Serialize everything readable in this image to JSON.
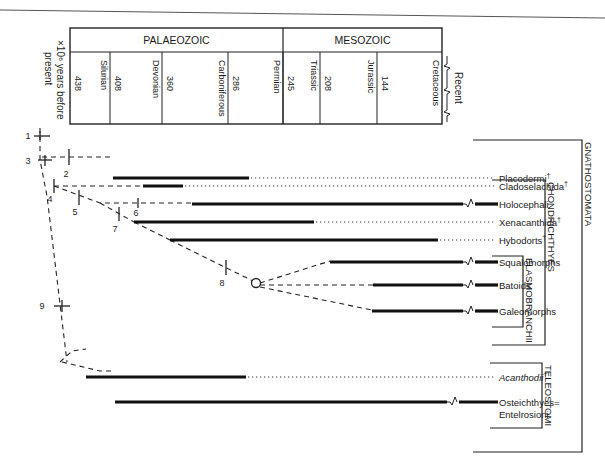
{
  "header": {
    "axis_label_lines": [
      "×10⁶ years before",
      "present"
    ],
    "eras": [
      {
        "name": "PALAEOZOIC",
        "x1": 70,
        "x2": 283
      },
      {
        "name": "MESOZOIC",
        "x1": 283,
        "x2": 442
      }
    ],
    "periods": [
      {
        "name": "Silurian",
        "start": "438",
        "x1": 70,
        "x2": 110
      },
      {
        "name": "Devonian",
        "start": "408",
        "x1": 110,
        "x2": 162
      },
      {
        "name": "Carboniferous",
        "start": "360",
        "x1": 162,
        "x2": 228
      },
      {
        "name": "Permian",
        "start": "286",
        "x1": 228,
        "x2": 283
      },
      {
        "name": "Triassic",
        "start": "245",
        "x1": 283,
        "x2": 320
      },
      {
        "name": "Jurassic",
        "start": "208",
        "x1": 320,
        "x2": 377
      },
      {
        "name": "Cretaceous",
        "start": "144",
        "x1": 377,
        "x2": 442
      }
    ],
    "recent_label": "Recent"
  },
  "taxa": [
    {
      "name": "Placodermi",
      "dagger": true,
      "italic": false,
      "y": 178,
      "bar_x1": 113,
      "bar_x2": 249,
      "fossil_end": "extinct"
    },
    {
      "name": "Cladoselachida",
      "dagger": true,
      "italic": false,
      "y": 186,
      "bar_x1": 143,
      "bar_x2": 183,
      "fossil_end": "extinct"
    },
    {
      "name": "Holocephali",
      "dagger": false,
      "italic": false,
      "y": 204,
      "bar_x1": 192,
      "bar_x2": 463,
      "fossil_end": "living"
    },
    {
      "name": "Xenacanthida",
      "dagger": true,
      "italic": false,
      "y": 222,
      "bar_x1": 134,
      "bar_x2": 314,
      "fossil_end": "extinct"
    },
    {
      "name": "Hybodorts",
      "dagger": true,
      "italic": false,
      "y": 240,
      "bar_x1": 170,
      "bar_x2": 438,
      "fossil_end": "extinct"
    },
    {
      "name": "Squalomorphs",
      "dagger": false,
      "italic": false,
      "y": 262,
      "bar_x1": 330,
      "bar_x2": 463,
      "fossil_end": "living"
    },
    {
      "name": "Batoids",
      "dagger": false,
      "italic": false,
      "y": 285,
      "bar_x1": 373,
      "bar_x2": 463,
      "fossil_end": "living"
    },
    {
      "name": "Galeomorphs",
      "dagger": false,
      "italic": false,
      "y": 311,
      "bar_x1": 372,
      "bar_x2": 463,
      "fossil_end": "living"
    },
    {
      "name": "Acanthodii",
      "dagger": true,
      "italic": true,
      "y": 377,
      "bar_x1": 86,
      "bar_x2": 246,
      "fossil_end": "extinct"
    },
    {
      "name": "Osteichthyes=",
      "name_line2": "Entelrosioni",
      "dagger": false,
      "italic": false,
      "y": 402,
      "bar_x1": 115,
      "bar_x2": 447,
      "fossil_end": "living"
    }
  ],
  "nodes": [
    {
      "label": "1",
      "x": 12,
      "y": 138
    },
    {
      "label": "2",
      "x": 70,
      "y": 158
    },
    {
      "label": "3",
      "x": 30,
      "y": 162
    },
    {
      "label": "4",
      "x": 55,
      "y": 196
    },
    {
      "label": "5",
      "x": 79,
      "y": 210
    },
    {
      "label": "6",
      "x": 138,
      "y": 210
    },
    {
      "label": "7",
      "x": 119,
      "y": 228
    },
    {
      "label": "8",
      "x": 226,
      "y": 282
    },
    {
      "label": "9",
      "x": 47,
      "y": 306
    }
  ],
  "groups": [
    {
      "name": "GNATHOSTOMATA",
      "x": 590,
      "y1": 140,
      "y2": 452
    },
    {
      "name": "CHONDRICHTHYES",
      "x": 553,
      "y1": 180,
      "y2": 345
    },
    {
      "name": "ELASMOBRANCHII",
      "x": 531,
      "y1": 256,
      "y2": 327
    },
    {
      "name": "TELEOSTOMI",
      "x": 550,
      "y1": 363,
      "y2": 428
    }
  ]
}
